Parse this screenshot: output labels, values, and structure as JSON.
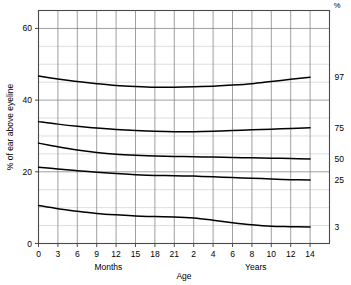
{
  "chart_data": {
    "type": "line",
    "title": "",
    "xlabel": "Age",
    "ylabel": "% of ear above eyeline",
    "corner_unit_label": "%",
    "xlim": [
      0,
      15
    ],
    "ylim": [
      0,
      65
    ],
    "grid": true,
    "legend_position": "right-inline",
    "x_tick_labels": [
      "0",
      "3",
      "6",
      "9",
      "12",
      "15",
      "18",
      "21",
      "2",
      "4",
      "6",
      "8",
      "10",
      "12",
      "14"
    ],
    "x_tick_positions": [
      0,
      1,
      2,
      3,
      4,
      5,
      6,
      7,
      8,
      9,
      10,
      11,
      12,
      13,
      14
    ],
    "x_group_labels": [
      {
        "text": "Months",
        "position": 3.6
      },
      {
        "text": "Years",
        "position": 11.2
      }
    ],
    "y_tick_labels": [
      "0",
      "20",
      "40",
      "60"
    ],
    "y_tick_values": [
      0,
      20,
      40,
      60
    ],
    "y_minor_step": 5,
    "series": [
      {
        "name": "97",
        "label": "97",
        "x": [
          0,
          1,
          2,
          3,
          4,
          5,
          6,
          7,
          8,
          9,
          10,
          11,
          12,
          13,
          14
        ],
        "values": [
          46.7,
          45.9,
          45.2,
          44.6,
          44.1,
          43.8,
          43.6,
          43.6,
          43.7,
          43.9,
          44.2,
          44.6,
          45.2,
          45.8,
          46.4
        ]
      },
      {
        "name": "75",
        "label": "75",
        "x": [
          0,
          1,
          2,
          3,
          4,
          5,
          6,
          7,
          8,
          9,
          10,
          11,
          12,
          13,
          14
        ],
        "values": [
          34.0,
          33.3,
          32.7,
          32.2,
          31.8,
          31.5,
          31.3,
          31.2,
          31.2,
          31.3,
          31.5,
          31.7,
          31.9,
          32.1,
          32.3
        ]
      },
      {
        "name": "50",
        "label": "50",
        "x": [
          0,
          1,
          2,
          3,
          4,
          5,
          6,
          7,
          8,
          9,
          10,
          11,
          12,
          13,
          14
        ],
        "values": [
          28.0,
          27.0,
          26.1,
          25.4,
          24.9,
          24.6,
          24.4,
          24.3,
          24.2,
          24.1,
          24.0,
          23.9,
          23.8,
          23.7,
          23.6
        ]
      },
      {
        "name": "25",
        "label": "25",
        "x": [
          0,
          1,
          2,
          3,
          4,
          5,
          6,
          7,
          8,
          9,
          10,
          11,
          12,
          13,
          14
        ],
        "values": [
          21.3,
          20.8,
          20.3,
          19.9,
          19.5,
          19.2,
          19.0,
          18.9,
          18.8,
          18.6,
          18.4,
          18.2,
          18.0,
          17.8,
          17.7
        ]
      },
      {
        "name": "3",
        "label": "3",
        "x": [
          0,
          1,
          2,
          3,
          4,
          5,
          6,
          7,
          8,
          9,
          10,
          11,
          12,
          13,
          14
        ],
        "values": [
          10.6,
          9.7,
          9.0,
          8.4,
          8.0,
          7.7,
          7.5,
          7.4,
          7.1,
          6.5,
          5.8,
          5.2,
          4.8,
          4.7,
          4.6
        ]
      }
    ],
    "colors": {
      "curve": "#000000",
      "grid_major": "#888888",
      "grid_minor": "#c8c8c8",
      "axis": "#555555",
      "background": "#ffffff"
    }
  }
}
